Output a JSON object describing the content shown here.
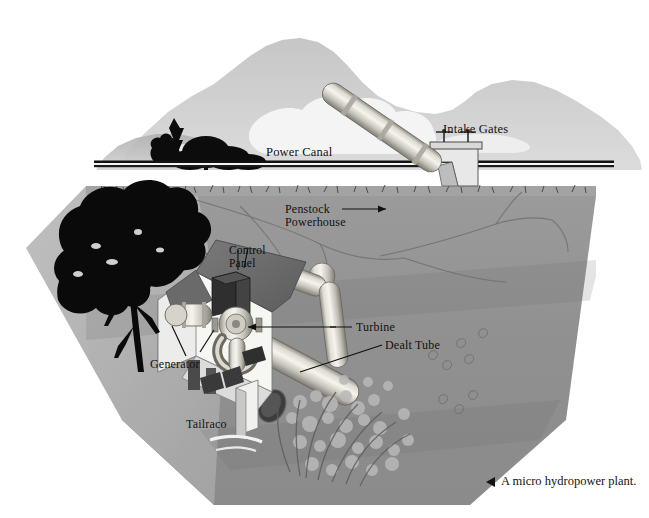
{
  "figure": {
    "caption": "A micro hydropower plant.",
    "caption_marker": "left-triangle-bullet",
    "top_cutoff_text": "Figure  —  micro hydropower plant layout",
    "title_alt": "Micro hydropower plant cutaway"
  },
  "labels": {
    "power_canal": "Power Canal",
    "intake_gates": "Intake Gates",
    "penstock": "Penstock",
    "powerhouse": "Powerhouse",
    "control_panel_line1": "Control",
    "control_panel_line2": "Panel",
    "turbine": "Turbine",
    "dealt_tube": "Dealt Tube",
    "generator": "Generator",
    "tailraco": "Tailraco"
  },
  "colors": {
    "page_background": "#ffffff",
    "sky_mountain_far": "#d3d3d3",
    "sky_mountain_near": "#bdbdbd",
    "cloud": "#f2f2f2",
    "tree_silhouette": "#0a0a0a",
    "soil_body": "#919191",
    "soil_left_light": "#b4b4b4",
    "soil_top_band": "#a8a8a8",
    "canal_line": "#111111",
    "penstock_pipe_light": "#f0efe9",
    "penstock_pipe_mid": "#c9c7bf",
    "penstock_pipe_shadow": "#8a8880",
    "powerhouse_wall": "#f5f5f2",
    "powerhouse_roof": "#6d6d6d",
    "control_panel_box": "#3a3a3a",
    "water_spray": "#a4a4a4",
    "label_text": "#111111",
    "caption_text": "#141414"
  },
  "scene_elements": [
    {
      "name": "sky-mountain-range",
      "kind": "background-silhouette"
    },
    {
      "name": "cloud-bank",
      "kind": "background-silhouette"
    },
    {
      "name": "conifer-tree-group",
      "kind": "silhouette"
    },
    {
      "name": "foreground-broadleaf-tree",
      "kind": "silhouette"
    },
    {
      "name": "ground-cross-section",
      "kind": "terrain"
    },
    {
      "name": "grass-turf-band",
      "kind": "terrain"
    },
    {
      "name": "root-crack-lines",
      "kind": "terrain-detail"
    },
    {
      "name": "power-canal-channel",
      "kind": "structure"
    },
    {
      "name": "intake-gate-structure",
      "kind": "structure"
    },
    {
      "name": "intake-gate-valve-wheels",
      "kind": "structure"
    },
    {
      "name": "penstock-pipe",
      "kind": "piping"
    },
    {
      "name": "powerhouse-building",
      "kind": "structure"
    },
    {
      "name": "control-panel-cabinet",
      "kind": "equipment"
    },
    {
      "name": "turbine-assembly",
      "kind": "equipment"
    },
    {
      "name": "generator-unit",
      "kind": "equipment"
    },
    {
      "name": "draft-tube",
      "kind": "piping"
    },
    {
      "name": "tailrace-outlet",
      "kind": "structure"
    },
    {
      "name": "tailrace-water-spray",
      "kind": "water"
    },
    {
      "name": "shrub-vegetation",
      "kind": "vegetation"
    }
  ],
  "leader_lines": [
    {
      "from": "penstock-label",
      "to": "penstock-pipe",
      "style": "arrow"
    },
    {
      "from": "turbine-label",
      "to": "turbine-assembly",
      "style": "arrow"
    },
    {
      "from": "dealt-tube-label",
      "to": "draft-tube",
      "style": "line"
    },
    {
      "from": "generator-label",
      "to": "generator-unit",
      "style": "line"
    },
    {
      "from": "control-panel-label",
      "to": "control-panel-cabinet",
      "style": "line"
    }
  ]
}
